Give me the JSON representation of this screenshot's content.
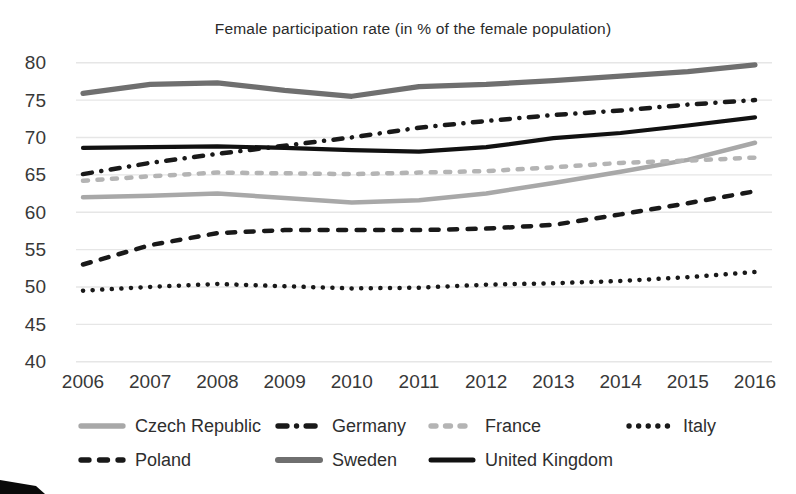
{
  "chart_data": {
    "type": "line",
    "title": "Female participation rate (in % of the female population)",
    "xlabel": "",
    "ylabel": "",
    "x": [
      2006,
      2007,
      2008,
      2009,
      2010,
      2011,
      2012,
      2013,
      2014,
      2015,
      2016
    ],
    "ylim": [
      40,
      80
    ],
    "yticks": [
      40,
      45,
      50,
      55,
      60,
      65,
      70,
      75,
      80
    ],
    "grid": "horizontal, faint light gray",
    "legend_position": "bottom, two rows",
    "series": [
      {
        "name": "Czech Republic",
        "color": "#a8a8a8",
        "style": "solid",
        "values": [
          62.0,
          62.2,
          62.5,
          61.9,
          61.3,
          61.6,
          62.5,
          63.9,
          65.4,
          67.0,
          69.3
        ]
      },
      {
        "name": "Germany",
        "color": "#191919",
        "style": "dash-dot",
        "values": [
          65.1,
          66.6,
          67.8,
          68.9,
          70.0,
          71.3,
          72.2,
          73.0,
          73.6,
          74.4,
          75.0
        ]
      },
      {
        "name": "France",
        "color": "#b4b4b4",
        "style": "dashed",
        "values": [
          64.2,
          64.8,
          65.3,
          65.2,
          65.1,
          65.3,
          65.5,
          66.0,
          66.6,
          66.9,
          67.3
        ]
      },
      {
        "name": "Italy",
        "color": "#191919",
        "style": "dotted",
        "values": [
          49.5,
          50.0,
          50.4,
          50.1,
          49.8,
          49.9,
          50.3,
          50.5,
          50.8,
          51.3,
          52.0
        ]
      },
      {
        "name": "Poland",
        "color": "#191919",
        "style": "dashed",
        "values": [
          53.0,
          55.6,
          57.2,
          57.6,
          57.6,
          57.6,
          57.8,
          58.3,
          59.7,
          61.2,
          62.8
        ]
      },
      {
        "name": "Sweden",
        "color": "#6f6f6f",
        "style": "solid",
        "values": [
          75.9,
          77.1,
          77.3,
          76.3,
          75.5,
          76.8,
          77.1,
          77.6,
          78.2,
          78.8,
          79.7
        ]
      },
      {
        "name": "United Kingdom",
        "color": "#111111",
        "style": "solid",
        "values": [
          68.6,
          68.7,
          68.8,
          68.6,
          68.3,
          68.1,
          68.7,
          69.9,
          70.6,
          71.6,
          72.7
        ]
      }
    ],
    "legend_rows": [
      [
        "Czech Republic",
        "Germany",
        "France",
        "Italy"
      ],
      [
        "Poland",
        "Sweden",
        "United Kingdom"
      ]
    ]
  },
  "colors": {
    "background": "#ffffff",
    "gridline": "#e6e6e6",
    "axis_text": "#383838",
    "title_text": "#2a2a2a"
  }
}
